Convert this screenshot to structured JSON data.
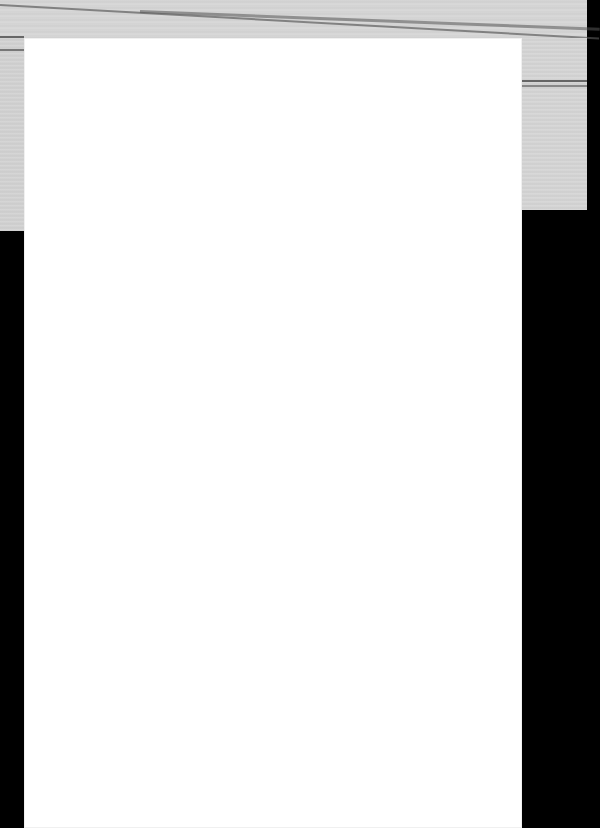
{
  "document": {
    "type": "scanned-page",
    "page_text": "",
    "blank": true
  },
  "colors": {
    "paper": "#ffffff",
    "background": "#000000",
    "scanner_lid": "#d4d4d4"
  }
}
